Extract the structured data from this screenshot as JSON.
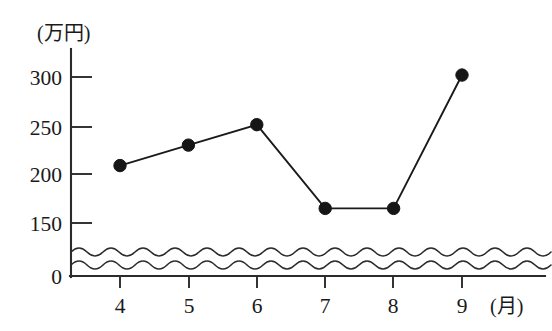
{
  "chart_data": {
    "type": "line",
    "title": "",
    "subtitle": "",
    "xlabel": "(月)",
    "ylabel": "(万円)",
    "categories": [
      "4",
      "5",
      "6",
      "7",
      "8",
      "9"
    ],
    "x": [
      4,
      5,
      6,
      7,
      8,
      9
    ],
    "values": [
      209,
      230,
      251,
      165,
      165,
      302
    ],
    "series": [
      {
        "name": "",
        "values": [
          209,
          230,
          251,
          165,
          165,
          302
        ]
      }
    ],
    "y_ticks": [
      0,
      150,
      200,
      250,
      300
    ],
    "y_tick_labels": [
      "0",
      "150",
      "200",
      "250",
      "300"
    ],
    "x_ticks": [
      4,
      5,
      6,
      7,
      8,
      9
    ],
    "x_tick_labels": [
      "4",
      "5",
      "6",
      "7",
      "8",
      "9"
    ],
    "ylim": [
      0,
      320
    ],
    "xlim": [
      3.5,
      9.7
    ],
    "grid": false,
    "legend": false,
    "legend_position": "none",
    "axis_break": {
      "present": true,
      "between": [
        0,
        150
      ],
      "style": "wavy-double"
    },
    "marker": "filled-circle",
    "annotations": []
  },
  "axis": {
    "y_unit_label": "(万円)",
    "x_unit_label": "(月)"
  },
  "colors": {
    "background": "#ffffff",
    "axis": "#2b2b2b",
    "line": "#1a1a1a",
    "marker": "#161616",
    "text": "#1a1a1a"
  }
}
